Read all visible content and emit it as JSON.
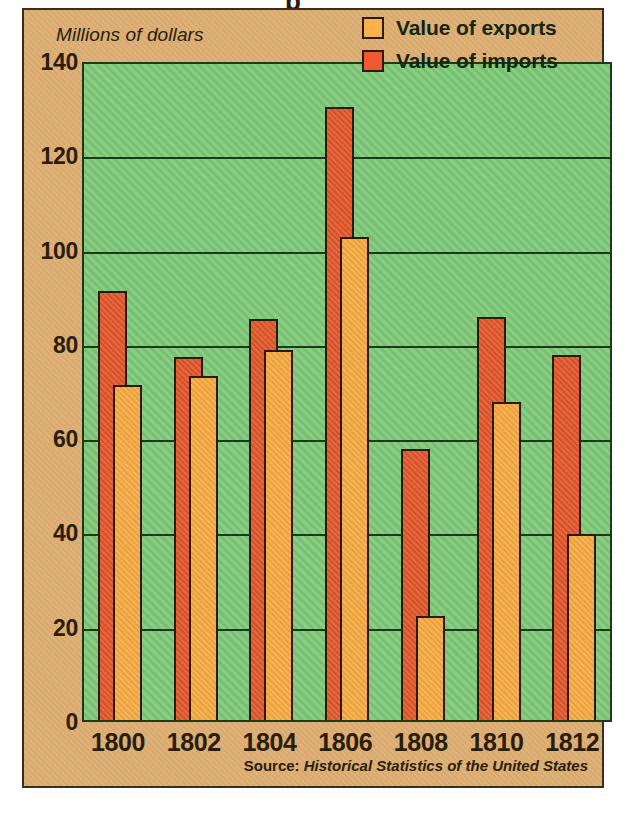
{
  "chart_data": {
    "type": "bar",
    "title": "",
    "xlabel": "",
    "ylabel": "Millions of dollars",
    "ylim": [
      0,
      140
    ],
    "ytick_values": [
      0,
      20,
      40,
      60,
      80,
      100,
      120,
      140
    ],
    "ytick_labels": [
      "0",
      "20",
      "40",
      "60",
      "80",
      "100",
      "120",
      "140"
    ],
    "grid": true,
    "grid_axis": "y",
    "legend_position": "top-right",
    "categories": [
      "1800",
      "1802",
      "1804",
      "1806",
      "1808",
      "1810",
      "1812"
    ],
    "series": [
      {
        "name": "Value of imports",
        "color": "#e1562a",
        "values": [
          91,
          77,
          85,
          130,
          57.5,
          85.5,
          77.5
        ]
      },
      {
        "name": "Value of exports",
        "color": "#f5a83f",
        "values": [
          71,
          73,
          78.5,
          102.5,
          22,
          67.5,
          39.5
        ]
      }
    ],
    "series_draw_order": [
      "Value of imports",
      "Value of exports"
    ],
    "source_prefix": "Source:",
    "source_title": "Historical Statistics of the United States"
  },
  "legend": {
    "items": [
      {
        "label": "Value of exports",
        "swatch": "exports"
      },
      {
        "label": "Value of imports",
        "swatch": "imports"
      }
    ]
  },
  "colors": {
    "plot_background": "#7cc877",
    "panel_background": "#ddae72",
    "exports_bar": "#f5a83f",
    "imports_bar": "#e1562a",
    "axis_line": "#1d3a1c",
    "text": "#2a1d0c"
  }
}
